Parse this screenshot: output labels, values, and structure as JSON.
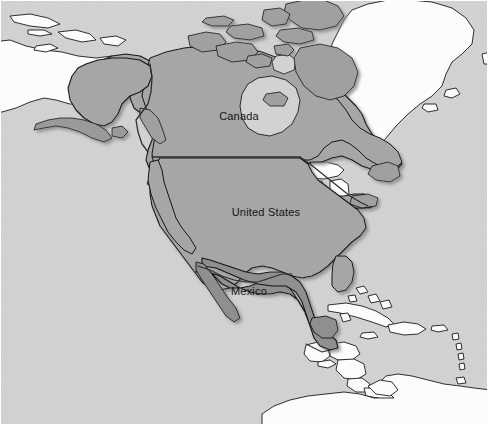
{
  "figure": {
    "kind": "reference-map",
    "width": 491,
    "height": 428
  },
  "colors": {
    "ocean": "#d2d2d2",
    "ocean_shade": "#cfcfcf",
    "land_unhighlighted": "#ffffff",
    "land_highlighted": "#a6a6a6",
    "land_highlighted_dark": "#8f8f8f",
    "coastline": "#1a1a1a",
    "internal_border": "#3a3a3a",
    "halo_shadow": "#b4b4b4",
    "label_text": "#141414",
    "frame": "#ffffff"
  },
  "labels": [
    {
      "id": "canada",
      "text": "Canada",
      "x": 239,
      "y": 116
    },
    {
      "id": "united-states",
      "text": "United States",
      "x": 266,
      "y": 212
    },
    {
      "id": "mexico",
      "text": "Mexico",
      "x": 249,
      "y": 291
    }
  ],
  "highlighted_regions": [
    "Canada",
    "United States",
    "Mexico"
  ],
  "unhighlighted_regions": [
    "Greenland",
    "Russia",
    "Cuba",
    "Bahamas",
    "Jamaica",
    "Hispaniola",
    "Puerto Rico",
    "Lesser Antilles",
    "Guatemala",
    "Belize",
    "Honduras",
    "El Salvador",
    "Nicaragua",
    "Costa Rica",
    "Panama",
    "Colombia",
    "Venezuela",
    "Guyana",
    "Suriname",
    "Brazil",
    "Great Lakes"
  ],
  "map_features": {
    "border_us_canada_parallel": "49th parallel straight boundary",
    "great_lakes_visible": true,
    "arctic_archipelago_visible": true,
    "alaska_highlighted": true
  }
}
